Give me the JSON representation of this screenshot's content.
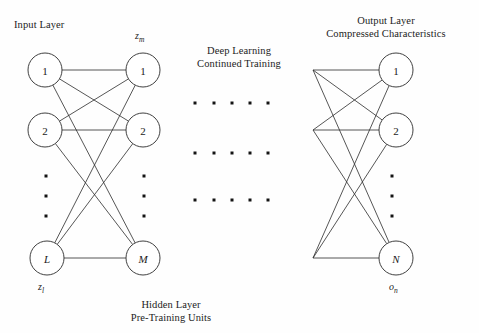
{
  "figure": {
    "type": "neural-network-architecture-diagram",
    "background_color": "#fefefe",
    "stroke_color": "#2b2b2b",
    "text_color": "#1c1c1c"
  },
  "captions": {
    "input_layer": "Input Layer",
    "deep_learning_line1": "Deep Learning",
    "deep_learning_line2": "Continued Training",
    "output_layer_line1": "Output Layer",
    "output_layer_line2": "Compressed Characteristics",
    "hidden_layer_line1": "Hidden Layer",
    "hidden_layer_line2": "Pre-Training Units"
  },
  "math_labels": {
    "z_m": "z",
    "z_m_sub": "m",
    "z_l": "z",
    "z_l_sub": "l",
    "o_n": "o",
    "o_n_sub": "n"
  },
  "left_block": {
    "input_column": {
      "nodes": [
        {
          "label": "1",
          "cx": 45,
          "cy": 70,
          "r": 17,
          "italic": false
        },
        {
          "label": "2",
          "cx": 45,
          "cy": 130,
          "r": 17,
          "italic": false
        },
        {
          "label": "L",
          "cx": 47,
          "cy": 258,
          "r": 17,
          "italic": true
        }
      ],
      "ellipsis_dots": [
        {
          "cx": 46,
          "cy": 176
        },
        {
          "cx": 46,
          "cy": 196
        },
        {
          "cx": 46,
          "cy": 216
        }
      ]
    },
    "hidden_column": {
      "nodes": [
        {
          "label": "1",
          "cx": 143,
          "cy": 70,
          "r": 17,
          "italic": false
        },
        {
          "label": "2",
          "cx": 143,
          "cy": 130,
          "r": 17,
          "italic": false
        },
        {
          "label": "M",
          "cx": 143,
          "cy": 258,
          "r": 17,
          "italic": true
        }
      ],
      "ellipsis_dots": [
        {
          "cx": 144,
          "cy": 176
        },
        {
          "cx": 144,
          "cy": 196
        },
        {
          "cx": 144,
          "cy": 216
        }
      ]
    }
  },
  "middle_block": {
    "dot_grid": {
      "columns_x": [
        195,
        214,
        232,
        250,
        268
      ],
      "rows_y": [
        103,
        153,
        200
      ]
    }
  },
  "right_block": {
    "source_column": {
      "vertices": [
        {
          "cx": 313,
          "cy": 70
        },
        {
          "cx": 313,
          "cy": 130
        },
        {
          "cx": 313,
          "cy": 258
        }
      ]
    },
    "output_column": {
      "nodes": [
        {
          "label": "1",
          "cx": 396,
          "cy": 70,
          "r": 17,
          "italic": false
        },
        {
          "label": "2",
          "cx": 396,
          "cy": 130,
          "r": 17,
          "italic": false
        },
        {
          "label": "N",
          "cx": 396,
          "cy": 258,
          "r": 17,
          "italic": true
        }
      ],
      "ellipsis_dots": [
        {
          "cx": 392,
          "cy": 176
        },
        {
          "cx": 392,
          "cy": 196
        },
        {
          "cx": 392,
          "cy": 216
        }
      ]
    }
  },
  "chart_data": {
    "type": "diagram",
    "layers": [
      {
        "name": "Input Layer",
        "units": [
          "1",
          "2",
          "L"
        ],
        "notation": "z_l"
      },
      {
        "name": "Hidden Layer / Pre-Training Units",
        "units": [
          "1",
          "2",
          "M"
        ],
        "notation": "z_m"
      },
      {
        "name": "Output Layer / Compressed Characteristics",
        "units": [
          "1",
          "2",
          "N"
        ],
        "notation": "o_n"
      }
    ],
    "connectivity": "fully-connected between adjacent layers",
    "middle_annotation": "Deep Learning Continued Training"
  }
}
